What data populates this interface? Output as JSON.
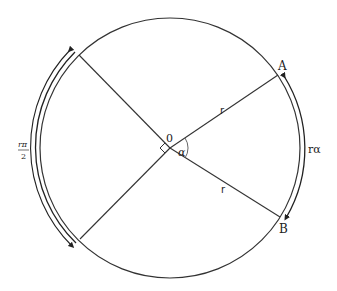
{
  "diagram": {
    "type": "circle-arc-length",
    "center": {
      "x": 170,
      "y": 148,
      "label": "0"
    },
    "radius_px": 130,
    "points": {
      "A": {
        "label": "A"
      },
      "B": {
        "label": "B"
      }
    },
    "radius_labels": [
      "r",
      "r"
    ],
    "angle_label": "α",
    "arc_AB_label": "rα",
    "quarter_arc_label": {
      "numerator": "rπ",
      "denominator": "2"
    },
    "right_angle_marker": true,
    "colors": {
      "stroke": "#222222",
      "background": "#ffffff"
    }
  }
}
